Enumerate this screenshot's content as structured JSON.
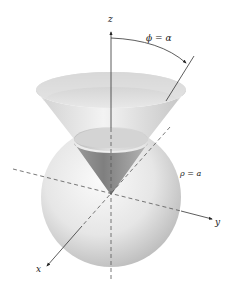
{
  "diagram": {
    "type": "3d-surface-illustration",
    "axes": {
      "z_label": "z",
      "y_label": "y",
      "x_label": "x",
      "origin_label": "O"
    },
    "annotations": {
      "angle_label": "ϕ = α",
      "sphere_label": "ρ = a"
    },
    "colors": {
      "surface_light": "#f2f2f2",
      "surface_mid": "#d6d6d6",
      "surface_dark": "#9a9a9a",
      "axis": "#333333"
    }
  }
}
